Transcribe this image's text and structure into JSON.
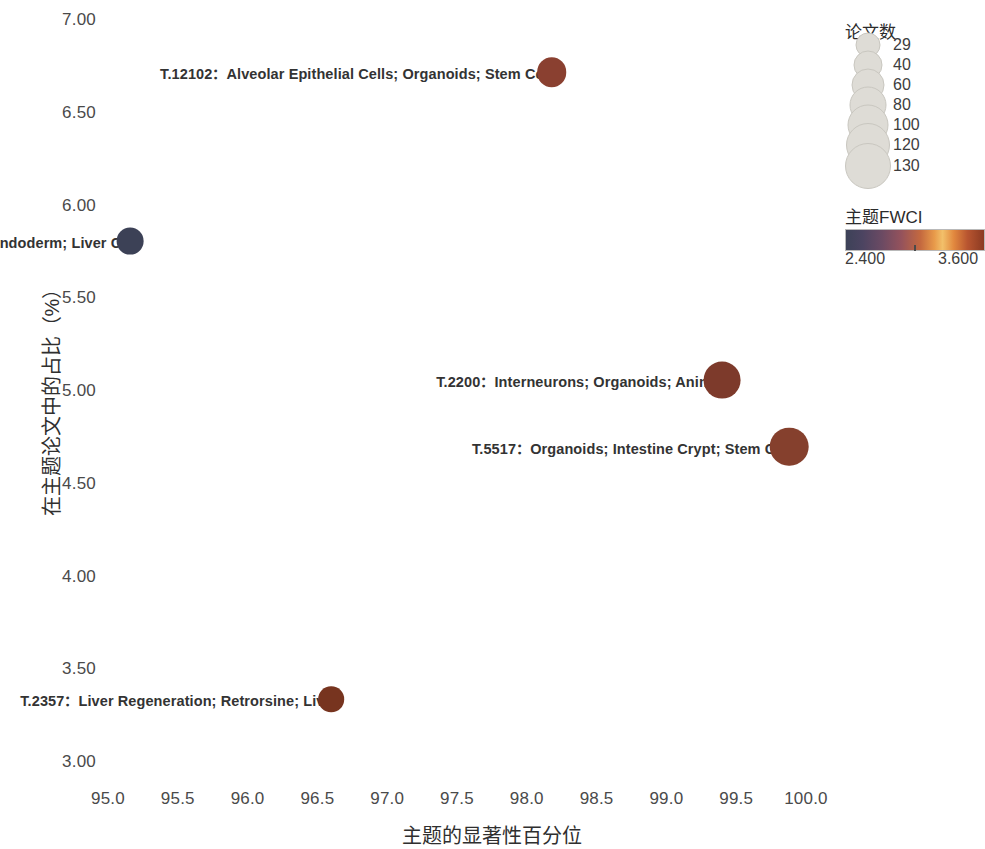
{
  "chart_data": {
    "type": "scatter",
    "title": "",
    "xlabel": "主题的显著性百分位",
    "ylabel": "在主题论文中的占比（%）",
    "xlim": [
      94.75,
      100.25
    ],
    "ylim": [
      3.0,
      7.0
    ],
    "grid": false,
    "xticks": [
      "95.0",
      "95.5",
      "96.0",
      "96.5",
      "97.0",
      "97.5",
      "98.0",
      "98.5",
      "99.0",
      "99.5",
      "100.0"
    ],
    "xtick_values": [
      95.0,
      95.5,
      96.0,
      96.5,
      97.0,
      97.5,
      98.0,
      98.5,
      99.0,
      99.5,
      100.0
    ],
    "yticks": [
      "3.00",
      "3.50",
      "4.00",
      "4.50",
      "5.00",
      "5.50",
      "6.00",
      "6.50",
      "7.00"
    ],
    "ytick_values": [
      3.0,
      3.5,
      4.0,
      4.5,
      5.0,
      5.5,
      6.0,
      6.5,
      7.0
    ],
    "points": [
      {
        "id": "T.12102",
        "label": "T.12102：Alveolar Epithelial Cells; Organoids; Stem Cells",
        "topic_id": "T.12102",
        "keywords": "Alveolar Epithelial Cells; Organoids; Stem Cells",
        "x": 98.18,
        "y": 6.72,
        "size": 52,
        "fwci": 3.42,
        "color": "#8a4030"
      },
      {
        "id": "T.21837",
        "label": "T.21837：Hepatocytes; Endoderm; Liver Cell",
        "topic_id": "T.21837",
        "keywords": "Hepatocytes; Endoderm; Liver Cell",
        "x": 95.16,
        "y": 5.81,
        "size": 35,
        "fwci": 2.42,
        "color": "#3c4156"
      },
      {
        "id": "T.2200",
        "label": "T.2200：Interneurons; Organoids; Animals",
        "topic_id": "T.2200",
        "keywords": "Interneurons; Organoids; Animals",
        "x": 99.4,
        "y": 5.06,
        "size": 112,
        "fwci": 3.5,
        "color": "#7d3a2b"
      },
      {
        "id": "T.5517",
        "label": "T.5517：Organoids; Intestine Crypt; Stem Cells",
        "topic_id": "T.5517",
        "keywords": "Organoids; Intestine Crypt; Stem Cells",
        "x": 99.88,
        "y": 4.7,
        "size": 130,
        "fwci": 3.46,
        "color": "#85402d"
      },
      {
        "id": "T.2357",
        "label": "T.2357：Liver Regeneration; Retrorsine; Liver",
        "topic_id": "T.2357",
        "keywords": "Liver Regeneration; Retrorsine; Liver",
        "x": 96.6,
        "y": 3.34,
        "size": 29,
        "fwci": 3.38,
        "color": "#77341f"
      }
    ]
  },
  "size_legend": {
    "title": "论文数",
    "entries": [
      {
        "value": "29",
        "radius": 11.5
      },
      {
        "value": "40",
        "radius": 13.5
      },
      {
        "value": "60",
        "radius": 15.5
      },
      {
        "value": "80",
        "radius": 17.5
      },
      {
        "value": "100",
        "radius": 19.5
      },
      {
        "value": "120",
        "radius": 21.0
      },
      {
        "value": "130",
        "radius": 22.0
      }
    ]
  },
  "color_legend": {
    "title": "主题FWCI",
    "min": "2.400",
    "max": "3.600",
    "colormap_low": "#3d4258",
    "colormap_mid": "#f2c06a",
    "colormap_high": "#8b3a22"
  }
}
